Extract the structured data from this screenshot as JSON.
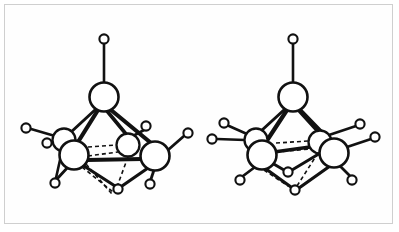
{
  "figure": {
    "background_color": "#ffffff",
    "frame_color": "#cfcfcf",
    "line_color": "#111111",
    "width": 399,
    "height": 232,
    "caption": ""
  },
  "structures": [
    {
      "id": "left-cluster",
      "name": "left-molecular-cluster",
      "label": "",
      "apex": {
        "name": "apex-metal-atom",
        "cx": 104,
        "cy": 97,
        "r": 14.5,
        "type": "metal"
      },
      "apex_hydrogen": {
        "name": "apex-terminal-hydrogen",
        "cx": 104,
        "cy": 39,
        "r": 4.6,
        "type": "hydrogen"
      },
      "metal_atoms": [
        {
          "name": "metal-atom-front-left",
          "cx": 74,
          "cy": 155,
          "r": 14.5,
          "type": "metal",
          "depth": "front"
        },
        {
          "name": "metal-atom-front-right",
          "cx": 155,
          "cy": 156,
          "r": 14.5,
          "type": "metal",
          "depth": "front"
        },
        {
          "name": "metal-atom-back-left",
          "cx": 64,
          "cy": 140,
          "r": 11.5,
          "type": "metal",
          "depth": "back"
        },
        {
          "name": "metal-atom-back-right",
          "cx": 128,
          "cy": 145,
          "r": 11.5,
          "type": "metal",
          "depth": "back"
        }
      ],
      "hydrogen_atoms": [
        {
          "name": "terminal-hydrogen-left-upper",
          "cx": 26,
          "cy": 128,
          "r": 4.6
        },
        {
          "name": "terminal-hydrogen-left-lower",
          "cx": 47,
          "cy": 143,
          "r": 4.6
        },
        {
          "name": "terminal-hydrogen-bottom-left",
          "cx": 55,
          "cy": 183,
          "r": 4.6
        },
        {
          "name": "terminal-hydrogen-right-upper",
          "cx": 146,
          "cy": 126,
          "r": 4.6
        },
        {
          "name": "terminal-hydrogen-right-outer",
          "cx": 188,
          "cy": 133,
          "r": 4.6
        },
        {
          "name": "terminal-hydrogen-bottom-right",
          "cx": 150,
          "cy": 184,
          "r": 4.6
        },
        {
          "name": "bridging-hydrogen-bottom",
          "cx": 118,
          "cy": 189,
          "r": 4.6
        }
      ],
      "solid_bonds": [
        {
          "name": "bond-apex-to-hydrogen",
          "x1": 104,
          "y1": 43,
          "x2": 104,
          "y2": 83,
          "width": 2.6
        },
        {
          "name": "bond-apex-to-front-left",
          "x1": 98,
          "y1": 110,
          "x2": 78,
          "y2": 142,
          "width": 4.2
        },
        {
          "name": "bond-apex-to-front-right",
          "x1": 111,
          "y1": 110,
          "x2": 151,
          "y2": 143,
          "width": 4.2
        },
        {
          "name": "bond-apex-to-back-right",
          "x1": 107,
          "y1": 111,
          "x2": 126,
          "y2": 134,
          "width": 3.6
        },
        {
          "name": "bond-apex-to-back-left",
          "x1": 96,
          "y1": 109,
          "x2": 70,
          "y2": 133,
          "width": 3.0
        },
        {
          "name": "bond-front-left-to-front-right",
          "x1": 87,
          "y1": 160,
          "x2": 142,
          "y2": 159,
          "width": 4.0
        },
        {
          "name": "bond-back-left-to-front-left",
          "x1": 67,
          "y1": 150,
          "x2": 72,
          "y2": 144,
          "width": 3.0
        },
        {
          "name": "bond-back-left-hydrogen-upper",
          "x1": 55,
          "y1": 136,
          "x2": 31,
          "y2": 129,
          "width": 2.6
        },
        {
          "name": "bond-back-left-hydrogen-lower",
          "x1": 54,
          "y1": 141,
          "x2": 51,
          "y2": 142,
          "width": 2.6
        },
        {
          "name": "bond-front-left-hydrogen-bottom",
          "x1": 68,
          "y1": 167,
          "x2": 57,
          "y2": 179,
          "width": 2.8
        },
        {
          "name": "bond-back-right-hydrogen-upper",
          "x1": 133,
          "y1": 136,
          "x2": 144,
          "y2": 130,
          "width": 2.6
        },
        {
          "name": "bond-front-right-hydrogen-outer",
          "x1": 168,
          "y1": 150,
          "x2": 184,
          "y2": 136,
          "width": 2.8
        },
        {
          "name": "bond-front-right-hydrogen-bottom",
          "x1": 154,
          "y1": 170,
          "x2": 151,
          "y2": 179,
          "width": 2.8
        },
        {
          "name": "bond-front-left-to-bridge",
          "x1": 84,
          "y1": 166,
          "x2": 115,
          "y2": 186,
          "width": 3.2
        },
        {
          "name": "bond-front-right-to-bridge",
          "x1": 148,
          "y1": 168,
          "x2": 122,
          "y2": 186,
          "width": 3.2
        },
        {
          "name": "bond-back-left-to-bottom-left",
          "x1": 62,
          "y1": 151,
          "x2": 56,
          "y2": 178,
          "width": 2.6
        }
      ],
      "hidden_bonds": [
        {
          "name": "hidden-bond-front-left-to-back-right-upper",
          "x1": 88,
          "y1": 147,
          "x2": 117,
          "y2": 145
        },
        {
          "name": "hidden-bond-front-left-to-back-right-lower",
          "x1": 88,
          "y1": 156,
          "x2": 118,
          "y2": 152
        },
        {
          "name": "hidden-bond-back-right-to-bridge",
          "x1": 128,
          "y1": 157,
          "x2": 118,
          "y2": 184
        },
        {
          "name": "hidden-bond-front-left-to-lower-bridge",
          "x1": 82,
          "y1": 167,
          "x2": 113,
          "y2": 192
        },
        {
          "name": "hidden-bond-diagonal-core",
          "x1": 86,
          "y1": 164,
          "x2": 112,
          "y2": 194
        }
      ]
    },
    {
      "id": "right-cluster",
      "name": "right-molecular-cluster",
      "label": "",
      "apex": {
        "name": "apex-metal-atom",
        "cx": 293,
        "cy": 97,
        "r": 14.5,
        "type": "metal"
      },
      "apex_hydrogen": {
        "name": "apex-terminal-hydrogen",
        "cx": 293,
        "cy": 39,
        "r": 4.6,
        "type": "hydrogen"
      },
      "metal_atoms": [
        {
          "name": "metal-atom-front-left",
          "cx": 262,
          "cy": 155,
          "r": 14.5,
          "type": "metal",
          "depth": "front"
        },
        {
          "name": "metal-atom-front-right",
          "cx": 334,
          "cy": 153,
          "r": 14.5,
          "type": "metal",
          "depth": "front"
        },
        {
          "name": "metal-atom-back-left",
          "cx": 256,
          "cy": 140,
          "r": 11.5,
          "type": "metal",
          "depth": "back"
        },
        {
          "name": "metal-atom-back-right",
          "cx": 320,
          "cy": 142,
          "r": 11.5,
          "type": "metal",
          "depth": "back"
        }
      ],
      "hydrogen_atoms": [
        {
          "name": "terminal-hydrogen-left-upper",
          "cx": 224,
          "cy": 123,
          "r": 4.6
        },
        {
          "name": "terminal-hydrogen-left-outer",
          "cx": 212,
          "cy": 139,
          "r": 4.6
        },
        {
          "name": "terminal-hydrogen-bottom-left",
          "cx": 240,
          "cy": 180,
          "r": 4.6
        },
        {
          "name": "terminal-hydrogen-right-upper",
          "cx": 360,
          "cy": 124,
          "r": 4.6
        },
        {
          "name": "terminal-hydrogen-right-outer",
          "cx": 375,
          "cy": 137,
          "r": 4.6
        },
        {
          "name": "terminal-hydrogen-bottom-right",
          "cx": 352,
          "cy": 180,
          "r": 4.6
        },
        {
          "name": "bridging-hydrogen-upper",
          "cx": 288,
          "cy": 172,
          "r": 4.6
        },
        {
          "name": "bridging-hydrogen-lower",
          "cx": 295,
          "cy": 190,
          "r": 4.6
        }
      ],
      "solid_bonds": [
        {
          "name": "bond-apex-to-hydrogen",
          "x1": 293,
          "y1": 43,
          "x2": 293,
          "y2": 83,
          "width": 2.6
        },
        {
          "name": "bond-apex-to-front-left",
          "x1": 287,
          "y1": 110,
          "x2": 266,
          "y2": 142,
          "width": 4.2
        },
        {
          "name": "bond-apex-to-front-right",
          "x1": 300,
          "y1": 110,
          "x2": 330,
          "y2": 141,
          "width": 4.2
        },
        {
          "name": "bond-apex-to-back-left",
          "x1": 285,
          "y1": 109,
          "x2": 261,
          "y2": 131,
          "width": 3.0
        },
        {
          "name": "bond-apex-to-back-right",
          "x1": 298,
          "y1": 110,
          "x2": 318,
          "y2": 132,
          "width": 3.0
        },
        {
          "name": "bond-front-left-to-back-right",
          "x1": 274,
          "y1": 152,
          "x2": 310,
          "y2": 147,
          "width": 3.4
        },
        {
          "name": "bond-back-left-hydrogen-upper",
          "x1": 247,
          "y1": 134,
          "x2": 229,
          "y2": 126,
          "width": 2.6
        },
        {
          "name": "bond-back-left-hydrogen-outer",
          "x1": 245,
          "y1": 140,
          "x2": 217,
          "y2": 139,
          "width": 2.6
        },
        {
          "name": "bond-front-left-hydrogen-bottom",
          "x1": 255,
          "y1": 167,
          "x2": 243,
          "y2": 176,
          "width": 2.8
        },
        {
          "name": "bond-back-right-hydrogen-upper",
          "x1": 329,
          "y1": 135,
          "x2": 356,
          "y2": 126,
          "width": 2.6
        },
        {
          "name": "bond-front-right-hydrogen-outer",
          "x1": 347,
          "y1": 147,
          "x2": 371,
          "y2": 139,
          "width": 2.8
        },
        {
          "name": "bond-front-right-hydrogen-bottom",
          "x1": 340,
          "y1": 166,
          "x2": 350,
          "y2": 176,
          "width": 2.8
        },
        {
          "name": "bond-front-left-to-bridge-upper",
          "x1": 272,
          "y1": 163,
          "x2": 284,
          "y2": 170,
          "width": 3.0
        },
        {
          "name": "bond-bridge-upper-to-front-right",
          "x1": 292,
          "y1": 170,
          "x2": 322,
          "y2": 152,
          "width": 3.0
        },
        {
          "name": "bond-front-left-to-bridge-lower",
          "x1": 266,
          "y1": 169,
          "x2": 291,
          "y2": 187,
          "width": 3.2
        },
        {
          "name": "bond-bridge-lower-to-front-right",
          "x1": 299,
          "y1": 188,
          "x2": 330,
          "y2": 166,
          "width": 3.2
        }
      ],
      "hidden_bonds": [
        {
          "name": "hidden-bond-core-upper",
          "x1": 276,
          "y1": 143,
          "x2": 309,
          "y2": 141
        },
        {
          "name": "hidden-bond-core-lower",
          "x1": 276,
          "y1": 152,
          "x2": 309,
          "y2": 149
        },
        {
          "name": "hidden-bond-back-right-to-bridge-lower",
          "x1": 318,
          "y1": 153,
          "x2": 297,
          "y2": 186
        },
        {
          "name": "hidden-bond-front-left-to-bridge",
          "x1": 264,
          "y1": 170,
          "x2": 288,
          "y2": 186
        }
      ]
    }
  ]
}
